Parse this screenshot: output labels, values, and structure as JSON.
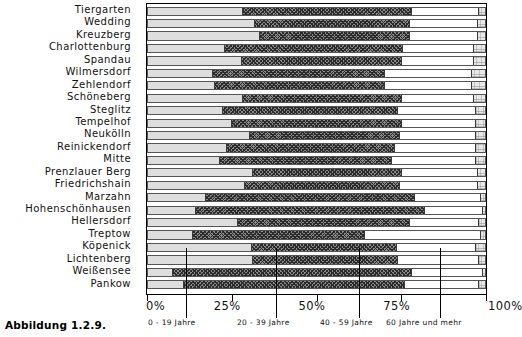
{
  "caption": "Abbildung 1.2.9.",
  "axis": {
    "ticks": [
      {
        "label": "0%",
        "value": 0
      },
      {
        "label": "25%",
        "value": 25
      },
      {
        "label": "50%",
        "value": 50
      },
      {
        "label": "75%",
        "value": 75
      },
      {
        "label": "100%",
        "value": 100
      }
    ]
  },
  "legend": [
    {
      "label": "0 - 19 Jahre",
      "pattern": "light-stipple",
      "x": 148,
      "leader_x": 186,
      "leader_top": 248
    },
    {
      "label": "20 - 39 Jahre",
      "pattern": "dark-cross-hatch",
      "x": 237,
      "leader_x": 276,
      "leader_top": 248
    },
    {
      "label": "40 - 59 Jahre",
      "pattern": "white",
      "x": 320,
      "leader_x": 359,
      "leader_top": 248
    },
    {
      "label": "60 Jahre und mehr",
      "pattern": "faint-stipple",
      "x": 386,
      "leader_x": 440,
      "leader_top": 248
    }
  ],
  "chart_data": {
    "type": "bar",
    "orientation": "horizontal",
    "stacked": true,
    "title": "",
    "xlabel": "",
    "ylabel": "",
    "xlim": [
      0,
      100
    ],
    "grid": false,
    "legend_position": "below-axis",
    "series": [
      {
        "name": "0 - 19 Jahre",
        "values": [
          28.0,
          31.5,
          33.0,
          22.5,
          27.5,
          19.0,
          19.5,
          28.0,
          22.0,
          24.5,
          30.0,
          23.0,
          21.0,
          31.0,
          28.5,
          17.0,
          14.0,
          26.5,
          13.0,
          30.5,
          31.0,
          7.0,
          10.5
        ]
      },
      {
        "name": "20 - 39 Jahre",
        "values": [
          50.0,
          46.0,
          44.5,
          53.0,
          47.5,
          51.0,
          50.5,
          47.0,
          52.0,
          50.5,
          44.5,
          50.0,
          51.0,
          44.0,
          46.0,
          62.0,
          68.0,
          51.0,
          51.0,
          43.0,
          43.0,
          71.0,
          65.5
        ]
      },
      {
        "name": "40 - 59 Jahre",
        "values": [
          20.0,
          20.0,
          20.0,
          21.0,
          21.5,
          26.0,
          26.0,
          21.5,
          23.0,
          22.0,
          22.5,
          24.0,
          25.0,
          22.5,
          23.0,
          19.5,
          17.0,
          20.5,
          34.5,
          23.5,
          24.0,
          21.0,
          22.0
        ]
      },
      {
        "name": "60 Jahre und mehr",
        "values": [
          2.0,
          2.5,
          2.5,
          3.5,
          3.5,
          4.0,
          4.0,
          3.5,
          3.0,
          3.0,
          3.0,
          3.0,
          3.0,
          2.5,
          2.5,
          1.5,
          1.0,
          2.0,
          1.5,
          3.0,
          2.0,
          1.0,
          2.0
        ]
      }
    ],
    "categories": [
      "Tiergarten",
      "Wedding",
      "Kreuzberg",
      "Charlottenburg",
      "Spandau",
      "Wilmersdorf",
      "Zehlendorf",
      "Schöneberg",
      "Steglitz",
      "Tempelhof",
      "Neukölln",
      "Reinickendorf",
      "Mitte",
      "Prenzlauer Berg",
      "Friedrichshain",
      "Marzahn",
      "Hohenschönhausen",
      "Hellersdorf",
      "Treptow",
      "Köpenick",
      "Lichtenberg",
      "Weißensee",
      "Pankow"
    ]
  }
}
